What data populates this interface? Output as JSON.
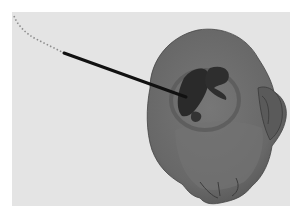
{
  "scene": {
    "description": "3D surface rendering of a head with an inserted probe and dotted trajectory",
    "colors": {
      "page_background": "#ffffff",
      "viewport_background": "#e4e4e4",
      "head_surface": "#6a6a6a",
      "head_shadow": "#4e4e4e",
      "lesion_dark": "#2a2a2a",
      "probe": "#111111",
      "trajectory_dots": "#9a9a9a"
    },
    "viewport": {
      "x": 12,
      "y": 12,
      "width": 278,
      "height": 194
    }
  }
}
